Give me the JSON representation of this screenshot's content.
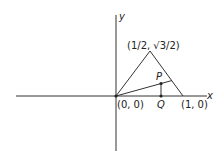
{
  "diagram": {
    "axes": {
      "x_label": "x",
      "y_label": "y"
    },
    "points": {
      "origin": {
        "label": "(0, 0)"
      },
      "apex": {
        "label": "(1/2, √3/2)"
      },
      "unit": {
        "label": "(1, 0)"
      },
      "P": {
        "label": "P"
      },
      "Q": {
        "label": "Q"
      }
    },
    "colors": {
      "stroke": "#333333",
      "text": "#222222",
      "background": "#ffffff"
    }
  }
}
